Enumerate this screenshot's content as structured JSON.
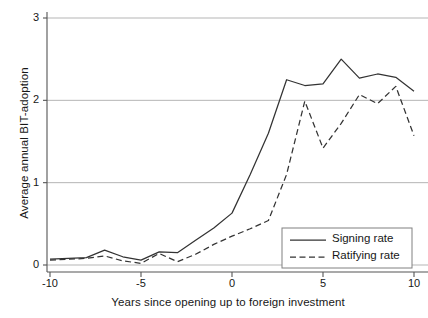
{
  "chart_data": {
    "type": "line",
    "title": "",
    "xlabel": "Years since opening up to foreign investment",
    "ylabel": "Average annual BIT-adoption",
    "xlim": [
      -10,
      10
    ],
    "ylim": [
      0,
      3
    ],
    "xticks": [
      -10,
      -5,
      0,
      5,
      10
    ],
    "xtick_labels": [
      "-10",
      "-5",
      "0",
      "5",
      "10"
    ],
    "yticks": [
      0,
      1,
      2,
      3
    ],
    "ytick_labels": [
      "0",
      "1",
      "2",
      "3"
    ],
    "grid": "horizontal",
    "legend_position": "lower-right-inside",
    "x": [
      -10,
      -9,
      -8,
      -7,
      -6,
      -5,
      -4,
      -3,
      -2,
      -1,
      0,
      1,
      2,
      3,
      4,
      5,
      6,
      7,
      8,
      9,
      10
    ],
    "series": [
      {
        "name": "Signing rate",
        "style": "solid",
        "color": "#333333",
        "values": [
          0.07,
          0.08,
          0.09,
          0.18,
          0.1,
          0.06,
          0.16,
          0.15,
          0.3,
          0.45,
          0.63,
          1.1,
          1.6,
          2.25,
          2.18,
          2.2,
          2.5,
          2.27,
          2.32,
          2.28,
          2.11
        ]
      },
      {
        "name": "Ratifying rate",
        "style": "dashed",
        "color": "#333333",
        "values": [
          0.06,
          0.07,
          0.08,
          0.11,
          0.05,
          0.02,
          0.14,
          0.04,
          0.13,
          0.25,
          0.35,
          0.44,
          0.54,
          1.1,
          1.99,
          1.42,
          1.72,
          2.07,
          1.96,
          2.17,
          1.57
        ]
      }
    ]
  },
  "legend": {
    "entries": [
      {
        "label": "Signing rate",
        "style": "solid"
      },
      {
        "label": "Ratifying rate",
        "style": "dashed"
      }
    ]
  },
  "colors": {
    "line": "#333333",
    "grid": "#b5b5b5",
    "axis": "#555555",
    "background": "#ffffff",
    "legend_border": "#808080"
  }
}
